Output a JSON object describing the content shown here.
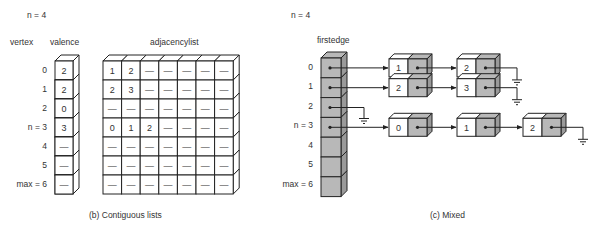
{
  "left_panel": {
    "n_label": "n = 4",
    "vertex_header": "vertex",
    "valence_header": "valence",
    "adjacency_header": "adjacencylist",
    "vertex_labels": [
      "0",
      "1",
      "2",
      "n = 3",
      "4",
      "5",
      "max = 6"
    ],
    "valence": [
      "2",
      "2",
      "0",
      "3",
      "—",
      "—",
      "—"
    ],
    "adjacency": [
      [
        "1",
        "2",
        "—",
        "—",
        "—",
        "—",
        "—"
      ],
      [
        "2",
        "3",
        "—",
        "—",
        "—",
        "—",
        "—"
      ],
      [
        "—",
        "—",
        "—",
        "—",
        "—",
        "—",
        "—"
      ],
      [
        "0",
        "1",
        "2",
        "—",
        "—",
        "—",
        "—"
      ],
      [
        "—",
        "—",
        "—",
        "—",
        "—",
        "—",
        "—"
      ],
      [
        "—",
        "—",
        "—",
        "—",
        "—",
        "—",
        "—"
      ],
      [
        "—",
        "—",
        "—",
        "—",
        "—",
        "—",
        "—"
      ]
    ],
    "caption": "(b)  Contiguous lists"
  },
  "right_panel": {
    "n_label": "n = 4",
    "firstedge_header": "firstedge",
    "vertex_labels": [
      "0",
      "1",
      "2",
      "n = 3",
      "4",
      "5",
      "max = 6"
    ],
    "lists": [
      {
        "vertex": 0,
        "nodes": [
          "1",
          "2"
        ]
      },
      {
        "vertex": 1,
        "nodes": [
          "2",
          "3"
        ]
      },
      {
        "vertex": 2,
        "nodes": []
      },
      {
        "vertex": 3,
        "nodes": [
          "0",
          "1",
          "2"
        ]
      }
    ],
    "caption": "(c)  Mixed"
  },
  "colors": {
    "line": "#222222",
    "shaded": "#b8b8b8",
    "shaded_side": "#9a9a9a",
    "white": "#ffffff"
  }
}
